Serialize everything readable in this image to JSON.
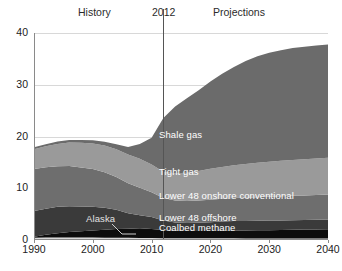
{
  "header": {
    "history_label": "History",
    "divider_year": "2012",
    "projections_label": "Projections"
  },
  "annotations": {
    "alaska": "Alaska"
  },
  "chart_data": {
    "type": "area",
    "title": "",
    "subtitle": "",
    "xlabel": "",
    "ylabel": "",
    "xlim": [
      1990,
      2040
    ],
    "ylim": [
      0,
      40
    ],
    "grid": true,
    "legend_position": "inline-labels",
    "stacked": true,
    "xticks": [
      1990,
      2000,
      2010,
      2020,
      2030,
      2040
    ],
    "yticks": [
      0,
      10,
      20,
      30,
      40
    ],
    "divider_x": 2012,
    "colors": {
      "alaska": "#d9d9d9",
      "coalbed_methane": "#0d0d0d",
      "lower_48_offshore": "#3a3a3a",
      "lower_48_onshore_conventional": "#6e6e6e",
      "tight_gas": "#9a9a9a",
      "shale_gas": "#6b6b6b",
      "gridline": "#d8d8d8",
      "axis": "#8a8a8a",
      "divider": "#555555",
      "text": "#1c1c1c",
      "inline_label_text": "#ffffff"
    },
    "x": [
      1990,
      1992,
      1994,
      1996,
      1998,
      2000,
      2002,
      2004,
      2006,
      2008,
      2010,
      2012,
      2014,
      2016,
      2018,
      2020,
      2022,
      2024,
      2026,
      2028,
      2030,
      2032,
      2034,
      2036,
      2038,
      2040
    ],
    "series": [
      {
        "name": "Alaska",
        "values": [
          0.45,
          0.46,
          0.47,
          0.48,
          0.48,
          0.47,
          0.45,
          0.44,
          0.42,
          0.4,
          0.38,
          0.36,
          0.35,
          0.34,
          0.33,
          0.33,
          0.32,
          0.32,
          0.31,
          0.31,
          0.3,
          0.3,
          0.3,
          0.29,
          0.29,
          0.29
        ]
      },
      {
        "name": "Coalbed methane",
        "values": [
          0.2,
          0.55,
          0.85,
          1.05,
          1.2,
          1.35,
          1.55,
          1.7,
          1.75,
          1.85,
          1.75,
          1.55,
          1.45,
          1.4,
          1.4,
          1.42,
          1.45,
          1.48,
          1.52,
          1.56,
          1.6,
          1.64,
          1.68,
          1.72,
          1.76,
          1.8
        ]
      },
      {
        "name": "Lower 48 offshore",
        "values": [
          4.95,
          5.05,
          5.1,
          5.0,
          4.8,
          4.6,
          4.25,
          3.7,
          3.0,
          2.55,
          2.3,
          1.85,
          1.6,
          1.55,
          1.6,
          1.7,
          1.8,
          1.85,
          1.85,
          1.85,
          1.85,
          1.85,
          1.85,
          1.85,
          1.85,
          1.85
        ]
      },
      {
        "name": "Lower 48 onshore conventional",
        "values": [
          8.1,
          8.0,
          7.85,
          7.75,
          7.55,
          7.3,
          6.85,
          6.35,
          5.8,
          5.3,
          4.8,
          4.35,
          4.25,
          4.25,
          4.3,
          4.35,
          4.4,
          4.45,
          4.5,
          4.55,
          4.6,
          4.65,
          4.7,
          4.75,
          4.8,
          4.85
        ]
      },
      {
        "name": "Tight gas",
        "values": [
          3.85,
          4.05,
          4.3,
          4.55,
          4.75,
          4.95,
          5.15,
          5.35,
          5.55,
          5.6,
          5.35,
          5.1,
          5.25,
          5.45,
          5.7,
          5.95,
          6.15,
          6.35,
          6.5,
          6.65,
          6.75,
          6.85,
          6.95,
          7.0,
          7.05,
          7.1
        ]
      },
      {
        "name": "Shale gas",
        "values": [
          0.35,
          0.4,
          0.45,
          0.5,
          0.55,
          0.6,
          0.75,
          0.95,
          1.45,
          2.85,
          5.2,
          10.35,
          12.9,
          14.4,
          15.6,
          16.9,
          18.0,
          19.0,
          19.9,
          20.6,
          21.1,
          21.4,
          21.6,
          21.75,
          21.85,
          21.9
        ]
      }
    ],
    "totals": [
      17.9,
      18.51,
      19.02,
      19.33,
      19.33,
      19.27,
      19.0,
      18.49,
      17.97,
      18.55,
      19.78,
      23.56,
      25.8,
      27.39,
      28.93,
      30.65,
      32.12,
      33.45,
      34.58,
      35.52,
      36.2,
      36.69,
      37.08,
      37.36,
      37.6,
      37.79
    ]
  }
}
